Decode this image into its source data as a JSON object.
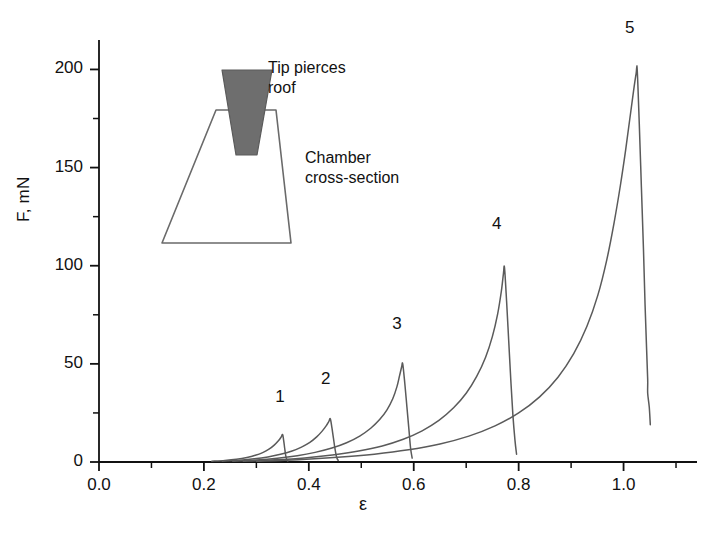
{
  "chart_data": {
    "type": "line",
    "title": "",
    "xlabel": "ε",
    "ylabel": "F, mN",
    "xlim": [
      0.0,
      1.14
    ],
    "ylim": [
      0,
      215
    ],
    "xticks": [
      0.0,
      0.2,
      0.4,
      0.6,
      0.8,
      1.0
    ],
    "xticklabels": [
      "0.0",
      "0.2",
      "0.4",
      "0.6",
      "0.8",
      "1.0"
    ],
    "xminor_step": 0.1,
    "yticks": [
      0,
      50,
      100,
      150,
      200
    ],
    "yticklabels": [
      "0",
      "50",
      "100",
      "150",
      "200"
    ],
    "yminor_step": 25,
    "grid": false,
    "legend": "none",
    "line_color": "#5a5a5a",
    "axis_color": "#111111",
    "series": [
      {
        "name": "1",
        "label": "1",
        "peak": {
          "x": 0.35,
          "y": 14
        },
        "label_pos": {
          "x": 0.345,
          "y": 28
        },
        "points": [
          [
            0.215,
            0.4
          ],
          [
            0.24,
            0.8
          ],
          [
            0.262,
            1.4
          ],
          [
            0.282,
            2.3
          ],
          [
            0.298,
            3.4
          ],
          [
            0.312,
            4.8
          ],
          [
            0.324,
            6.5
          ],
          [
            0.334,
            8.6
          ],
          [
            0.342,
            10.8
          ],
          [
            0.347,
            12.6
          ],
          [
            0.35,
            14.0
          ],
          [
            0.352,
            11.0
          ],
          [
            0.354,
            7.0
          ],
          [
            0.356,
            3.2
          ],
          [
            0.358,
            1.2
          ],
          [
            0.36,
            0.5
          ]
        ]
      },
      {
        "name": "2",
        "label": "2",
        "peak": {
          "x": 0.44,
          "y": 22
        },
        "label_pos": {
          "x": 0.432,
          "y": 37
        },
        "points": [
          [
            0.235,
            0.4
          ],
          [
            0.268,
            0.9
          ],
          [
            0.296,
            1.6
          ],
          [
            0.322,
            2.6
          ],
          [
            0.346,
            3.9
          ],
          [
            0.368,
            5.6
          ],
          [
            0.386,
            7.6
          ],
          [
            0.402,
            10.0
          ],
          [
            0.415,
            12.8
          ],
          [
            0.425,
            15.6
          ],
          [
            0.433,
            18.4
          ],
          [
            0.438,
            20.6
          ],
          [
            0.441,
            22.0
          ],
          [
            0.444,
            17.5
          ],
          [
            0.447,
            12.0
          ],
          [
            0.45,
            6.5
          ],
          [
            0.453,
            2.4
          ],
          [
            0.456,
            0.8
          ]
        ]
      },
      {
        "name": "3",
        "label": "3",
        "peak": {
          "x": 0.578,
          "y": 50
        },
        "label_pos": {
          "x": 0.568,
          "y": 65
        },
        "points": [
          [
            0.255,
            0.4
          ],
          [
            0.3,
            1.0
          ],
          [
            0.34,
            1.9
          ],
          [
            0.378,
            3.2
          ],
          [
            0.412,
            4.9
          ],
          [
            0.444,
            7.1
          ],
          [
            0.472,
            9.8
          ],
          [
            0.497,
            13.2
          ],
          [
            0.518,
            17.2
          ],
          [
            0.535,
            21.6
          ],
          [
            0.549,
            26.6
          ],
          [
            0.56,
            32.2
          ],
          [
            0.568,
            38.4
          ],
          [
            0.573,
            44.0
          ],
          [
            0.577,
            48.5
          ],
          [
            0.579,
            50.0
          ],
          [
            0.583,
            40.0
          ],
          [
            0.587,
            28.0
          ],
          [
            0.591,
            16.0
          ],
          [
            0.594,
            7.0
          ],
          [
            0.597,
            2.0
          ]
        ]
      },
      {
        "name": "4",
        "label": "4",
        "peak": {
          "x": 0.771,
          "y": 99
        },
        "label_pos": {
          "x": 0.758,
          "y": 116
        },
        "points": [
          [
            0.275,
            0.4
          ],
          [
            0.335,
            1.1
          ],
          [
            0.392,
            2.1
          ],
          [
            0.445,
            3.6
          ],
          [
            0.495,
            5.6
          ],
          [
            0.54,
            8.2
          ],
          [
            0.58,
            11.6
          ],
          [
            0.616,
            15.9
          ],
          [
            0.648,
            21.2
          ],
          [
            0.676,
            27.6
          ],
          [
            0.7,
            35.0
          ],
          [
            0.72,
            43.6
          ],
          [
            0.737,
            53.4
          ],
          [
            0.75,
            64.0
          ],
          [
            0.76,
            75.5
          ],
          [
            0.767,
            87.0
          ],
          [
            0.771,
            96.0
          ],
          [
            0.773,
            99.0
          ],
          [
            0.777,
            82.0
          ],
          [
            0.781,
            62.0
          ],
          [
            0.785,
            42.0
          ],
          [
            0.789,
            24.0
          ],
          [
            0.793,
            11.0
          ],
          [
            0.796,
            4.0
          ]
        ]
      },
      {
        "name": "5",
        "label": "5",
        "peak": {
          "x": 1.025,
          "y": 200
        },
        "label_pos": {
          "x": 1.012,
          "y": 216
        },
        "points": [
          [
            0.3,
            0.4
          ],
          [
            0.38,
            1.2
          ],
          [
            0.455,
            2.4
          ],
          [
            0.525,
            4.0
          ],
          [
            0.59,
            6.2
          ],
          [
            0.65,
            9.2
          ],
          [
            0.705,
            13.2
          ],
          [
            0.755,
            18.4
          ],
          [
            0.8,
            25.0
          ],
          [
            0.84,
            33.2
          ],
          [
            0.875,
            43.2
          ],
          [
            0.905,
            55.2
          ],
          [
            0.93,
            69.0
          ],
          [
            0.951,
            85.0
          ],
          [
            0.968,
            103.0
          ],
          [
            0.982,
            122.0
          ],
          [
            0.994,
            141.0
          ],
          [
            1.004,
            159.0
          ],
          [
            1.012,
            175.0
          ],
          [
            1.019,
            189.0
          ],
          [
            1.024,
            198.0
          ],
          [
            1.026,
            200.0
          ],
          [
            1.03,
            172.0
          ],
          [
            1.034,
            140.0
          ],
          [
            1.038,
            108.0
          ],
          [
            1.041,
            80.0
          ],
          [
            1.044,
            57.0
          ],
          [
            1.046,
            42.0
          ],
          [
            1.046,
            35.0
          ],
          [
            1.049,
            28.0
          ],
          [
            1.051,
            19.0
          ]
        ]
      }
    ]
  },
  "inset": {
    "tip_label_line1": "Tip pierces",
    "tip_label_line2": "roof",
    "chamber_label_line1": "Chamber",
    "chamber_label_line2": "cross-section",
    "tip_fill": "#6e6e6e",
    "outline_color": "#6a6a6a"
  }
}
